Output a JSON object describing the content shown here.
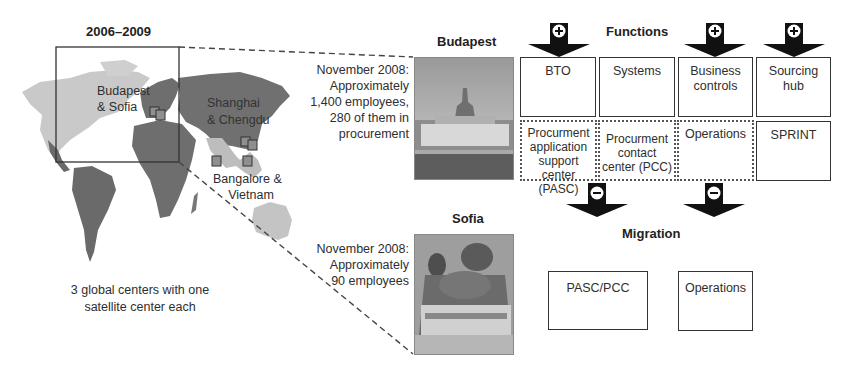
{
  "map": {
    "period_title": "2006–2009",
    "labels": {
      "budapest_sofia": [
        "Budapest",
        "& Sofia"
      ],
      "shanghai_chengdu": [
        "Shanghai",
        "& Chengdu"
      ],
      "bangalore_vietnam": [
        "Bangalore &",
        "Vietnam"
      ]
    },
    "caption": [
      "3 global centers with one",
      "satellite center each"
    ],
    "colors": {
      "americas": "#c8c8c8",
      "europe_asia_africa": "#6e6e6e",
      "asia_light": "#bdbdbd",
      "marker": "#8a8a8a"
    }
  },
  "budapest": {
    "title": "Budapest",
    "description": [
      "November 2008:",
      "Approximately",
      "1,400 employees,",
      "280 of them in",
      "procurement"
    ]
  },
  "sofia": {
    "title": "Sofia",
    "description": [
      "November 2008:",
      "Approximately",
      "90 employees"
    ]
  },
  "functions": {
    "title": "Functions",
    "top_boxes": [
      {
        "label": "BTO",
        "added": true
      },
      {
        "label": "Systems",
        "added": false
      },
      {
        "label": "Business controls",
        "added": true
      },
      {
        "label": "Sourcing hub",
        "added": true
      }
    ],
    "bottom_boxes": [
      {
        "label": "Procurment application support center (PASC)",
        "style": "dotted"
      },
      {
        "label": "Procurment contact center (PCC)",
        "style": "dotted"
      },
      {
        "label": "Operations",
        "style": "dotted"
      },
      {
        "label": "SPRINT",
        "style": "solid"
      }
    ],
    "add_symbol": "+",
    "remove_symbol": "−"
  },
  "migration": {
    "title": "Migration",
    "boxes": [
      {
        "label": "PASC/PCC"
      },
      {
        "label": "Operations"
      }
    ]
  }
}
